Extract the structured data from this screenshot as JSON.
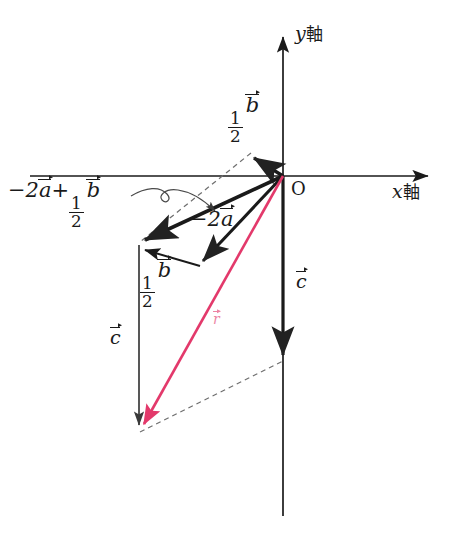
{
  "figure": {
    "type": "vector-diagram",
    "background_color": "#ffffff",
    "ink_color": "#1a1a1a",
    "accent_color": "#e3396b"
  },
  "axes": {
    "x_axis": {
      "label_var": "x",
      "label_suffix": "軸",
      "from": [
        30,
        176
      ],
      "to": [
        432,
        176
      ],
      "arrow": "right"
    },
    "y_axis": {
      "label_var": "y",
      "label_suffix": "軸",
      "from": [
        283,
        516
      ],
      "to": [
        283,
        33
      ],
      "arrow": "up"
    },
    "origin": {
      "label": "O",
      "at": [
        283,
        176
      ]
    }
  },
  "labels": {
    "half_b_upper": {
      "num": "1",
      "den": "2",
      "vec": "b"
    },
    "half_b_lower": {
      "num": "1",
      "den": "2",
      "vec": "b"
    },
    "minus_two_a": {
      "text": "−2",
      "vec": "a"
    },
    "sum_label": {
      "lead": "−2",
      "veca": "a",
      "plus": "+",
      "num": "1",
      "den": "2",
      "vecb": "b"
    },
    "c_right": {
      "vec": "c"
    },
    "c_left": {
      "vec": "c"
    },
    "r_red": {
      "vec": "r"
    }
  },
  "vectors": [
    {
      "name": "half-b-from-origin",
      "label": "1/2 b",
      "from": [
        283,
        176
      ],
      "to": [
        250,
        155
      ],
      "color": "#1a1a1a",
      "style": "solid",
      "width": 3.2
    },
    {
      "name": "minus-2a-from-origin",
      "label": "−2a",
      "from": [
        283,
        176
      ],
      "to": [
        198,
        266
      ],
      "color": "#1a1a1a",
      "style": "solid",
      "width": 3.0
    },
    {
      "name": "sum-vector",
      "label": "−2a + 1/2 b",
      "from": [
        283,
        176
      ],
      "to": [
        139,
        243
      ],
      "color": "#1a1a1a",
      "style": "solid",
      "width": 3.4
    },
    {
      "name": "half-b-lower",
      "label": "1/2 b",
      "from": [
        200,
        265
      ],
      "to": [
        139,
        248
      ],
      "color": "#1a1a1a",
      "style": "solid",
      "width": 2.0
    },
    {
      "name": "c-right",
      "label": "c",
      "from": [
        283,
        176
      ],
      "to": [
        283,
        362
      ],
      "color": "#1a1a1a",
      "style": "solid",
      "width": 3.2
    },
    {
      "name": "c-left",
      "label": "c",
      "from": [
        139,
        245
      ],
      "to": [
        139,
        432
      ],
      "color": "#555555",
      "style": "solid",
      "width": 1.6
    },
    {
      "name": "r-resultant",
      "label": "r",
      "from": [
        283,
        176
      ],
      "to": [
        139,
        433
      ],
      "color": "#e3396b",
      "style": "solid",
      "width": 2.4
    }
  ],
  "dashed_lines": [
    {
      "name": "parallelogram-upper",
      "from": [
        250,
        154
      ],
      "to": [
        139,
        243
      ]
    },
    {
      "name": "parallelogram-diagonal",
      "from": [
        250,
        154
      ],
      "to": [
        283,
        176
      ]
    },
    {
      "name": "parallelogram-lower",
      "from": [
        139,
        433
      ],
      "to": [
        283,
        362
      ]
    }
  ],
  "annotation_arrow": {
    "name": "callout-curve",
    "description": "curved arrow from the −2a+1/2b label to the sum vector"
  },
  "label_positions": {
    "y_axis": [
      295,
      28
    ],
    "x_axis": [
      396,
      184
    ],
    "origin": [
      293,
      182
    ],
    "half_b_upper": [
      230,
      97
    ],
    "sum_label": [
      8,
      182
    ],
    "minus_two_a": [
      192,
      212
    ],
    "half_b_lower": [
      141,
      262
    ],
    "c_right": [
      296,
      272
    ],
    "c_left": [
      110,
      328
    ],
    "r_red": [
      212,
      312
    ]
  }
}
